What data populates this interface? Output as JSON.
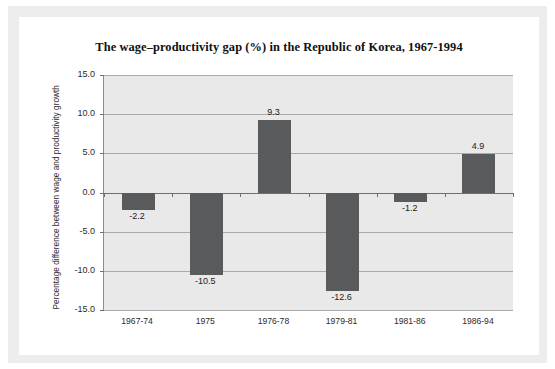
{
  "chart_data": {
    "type": "bar",
    "title": "The wage–productivity gap (%) in the Republic of Korea, 1967-1994",
    "xlabel": "",
    "ylabel": "Percentage difference between wage and productivity growth",
    "categories": [
      "1967-74",
      "1975",
      "1976-78",
      "1979-81",
      "1981-86",
      "1986-94"
    ],
    "values": [
      -2.2,
      -10.5,
      9.3,
      -12.6,
      -1.2,
      4.9
    ],
    "value_labels": [
      "-2.2",
      "-10.5",
      "9.3",
      "-12.6",
      "-1.2",
      "4.9"
    ],
    "ylim": [
      -15.0,
      15.0
    ],
    "ytick_values": [
      15.0,
      10.0,
      5.0,
      0.0,
      -5.0,
      -10.0,
      -15.0
    ],
    "ytick_labels": [
      "15.0",
      "10.0",
      "5.0",
      "0.0",
      "-5.0",
      "-10.0",
      "-15.0"
    ],
    "grid": true,
    "legend": null,
    "bar_color": "#595a5c",
    "plot_background": "#e9e9e9",
    "gridline_color": "#a9a9a9",
    "axis_color": "#6f6f6f"
  }
}
